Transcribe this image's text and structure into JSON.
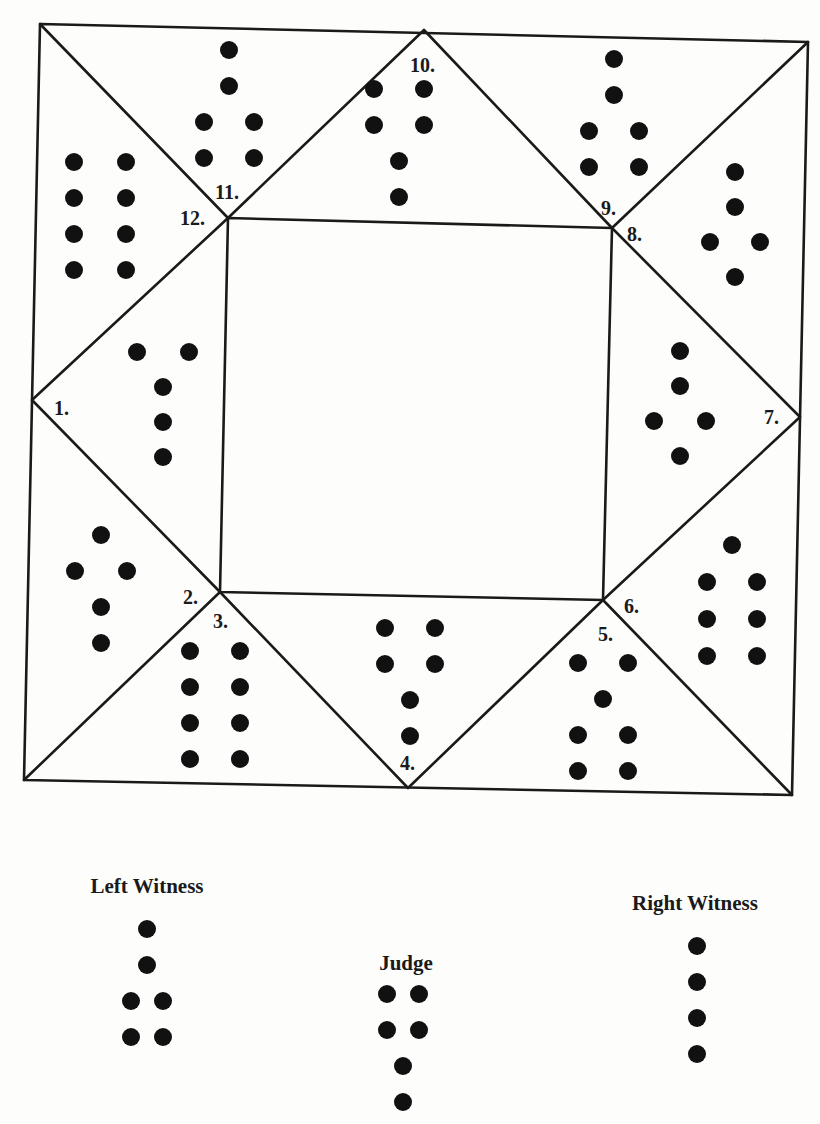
{
  "diagram": {
    "type": "geomantic-shield-square-chart",
    "ink_color": "#111111",
    "paper_color": "#fdfdfb",
    "houses": [
      {
        "number": 1,
        "label": "1.",
        "figure_rows": [
          2,
          1,
          1,
          1
        ]
      },
      {
        "number": 2,
        "label": "2.",
        "figure_rows": [
          1,
          2,
          1,
          1
        ]
      },
      {
        "number": 3,
        "label": "3.",
        "figure_rows": [
          2,
          2,
          2,
          2
        ]
      },
      {
        "number": 4,
        "label": "4.",
        "figure_rows": [
          2,
          2,
          1,
          1
        ]
      },
      {
        "number": 5,
        "label": "5.",
        "figure_rows": [
          2,
          1,
          2,
          2
        ]
      },
      {
        "number": 6,
        "label": "6.",
        "figure_rows": [
          1,
          2,
          2,
          2
        ]
      },
      {
        "number": 7,
        "label": "7.",
        "figure_rows": [
          1,
          1,
          2,
          1
        ]
      },
      {
        "number": 8,
        "label": "8.",
        "figure_rows": [
          1,
          1,
          2,
          1
        ]
      },
      {
        "number": 9,
        "label": "9.",
        "figure_rows": [
          1,
          1,
          2,
          2
        ]
      },
      {
        "number": 10,
        "label": "10.",
        "figure_rows": [
          2,
          2,
          1,
          1
        ]
      },
      {
        "number": 11,
        "label": "11.",
        "figure_rows": [
          1,
          1,
          2,
          2
        ]
      },
      {
        "number": 12,
        "label": "12.",
        "figure_rows": [
          2,
          2,
          2,
          2
        ]
      }
    ],
    "court": [
      {
        "name": "Left Witness",
        "figure_rows": [
          1,
          1,
          2,
          2
        ]
      },
      {
        "name": "Judge",
        "figure_rows": [
          2,
          2,
          1,
          1
        ]
      },
      {
        "name": "Right Witness",
        "figure_rows": [
          1,
          1,
          1,
          1
        ]
      }
    ]
  }
}
